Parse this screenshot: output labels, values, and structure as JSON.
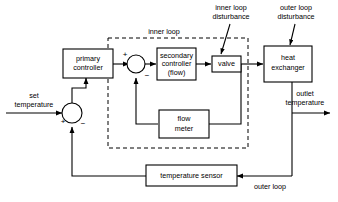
{
  "diagram": {
    "colors": {
      "stroke": "#000000",
      "background": "#ffffff",
      "box_fill": "#ffffff"
    },
    "blocks": [
      {
        "id": "primary_controller",
        "label_line1": "primary",
        "label_line2": "controller"
      },
      {
        "id": "secondary_controller",
        "label_line1": "secondary",
        "label_line2": "controller",
        "label_line3": "(flow)"
      },
      {
        "id": "valve",
        "label_line1": "valve"
      },
      {
        "id": "heat_exchanger",
        "label_line1": "heat",
        "label_line2": "exchanger"
      },
      {
        "id": "flow_meter",
        "label_line1": "flow",
        "label_line2": "meter"
      },
      {
        "id": "temperature_sensor",
        "label_line1": "temperature sensor"
      }
    ],
    "labels": {
      "set_temperature_line1": "set",
      "set_temperature_line2": "temperature",
      "inner_loop": "inner loop",
      "inner_loop_disturbance_line1": "inner loop",
      "inner_loop_disturbance_line2": "disturbance",
      "outer_loop_disturbance_line1": "outer loop",
      "outer_loop_disturbance_line2": "disturbance",
      "outlet_temperature_line1": "outlet",
      "outlet_temperature_line2": "temperature",
      "outer_loop": "outer loop"
    },
    "signs": {
      "outer_junction_plus": "+",
      "outer_junction_minus": "−",
      "inner_junction_plus": "+",
      "inner_junction_minus": "−"
    }
  }
}
